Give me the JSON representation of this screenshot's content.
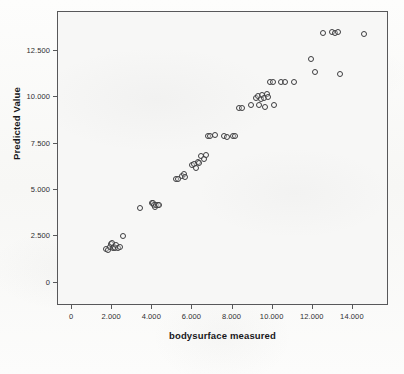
{
  "chart_data": {
    "type": "scatter",
    "title": "",
    "xlabel": "bodysurface measured",
    "ylabel": "Predicted Value",
    "xlim": [
      -700,
      15800
    ],
    "ylim": [
      -1250,
      14600
    ],
    "grid": false,
    "legend": "none",
    "marker": "open-circle",
    "xticks": [
      0,
      2000,
      4000,
      6000,
      8000,
      10000,
      12000,
      14000
    ],
    "xticklabels": [
      "0",
      "2.000",
      "4.000",
      "6.000",
      "8.000",
      "10.000",
      "12.000",
      "14.000"
    ],
    "yticks": [
      0,
      2500,
      5000,
      7500,
      10000,
      12500
    ],
    "yticklabels": [
      "0",
      "2.500",
      "5.000",
      "7.500",
      "10.000",
      "12.500"
    ],
    "points": [
      {
        "x": 1680,
        "y": 1800
      },
      {
        "x": 1800,
        "y": 1780
      },
      {
        "x": 1880,
        "y": 1950
      },
      {
        "x": 1950,
        "y": 2080
      },
      {
        "x": 2000,
        "y": 2150
      },
      {
        "x": 2030,
        "y": 1900
      },
      {
        "x": 2090,
        "y": 1950
      },
      {
        "x": 2130,
        "y": 1850
      },
      {
        "x": 2200,
        "y": 2050
      },
      {
        "x": 2280,
        "y": 1900
      },
      {
        "x": 2400,
        "y": 1950
      },
      {
        "x": 2550,
        "y": 2520
      },
      {
        "x": 3400,
        "y": 4050
      },
      {
        "x": 3980,
        "y": 4280
      },
      {
        "x": 4040,
        "y": 4300
      },
      {
        "x": 4080,
        "y": 4180
      },
      {
        "x": 4130,
        "y": 4100
      },
      {
        "x": 4200,
        "y": 4180
      },
      {
        "x": 4260,
        "y": 4220
      },
      {
        "x": 4320,
        "y": 4200
      },
      {
        "x": 5160,
        "y": 5620
      },
      {
        "x": 5300,
        "y": 5620
      },
      {
        "x": 5480,
        "y": 5780
      },
      {
        "x": 5560,
        "y": 5880
      },
      {
        "x": 5620,
        "y": 5700
      },
      {
        "x": 5980,
        "y": 6350
      },
      {
        "x": 6060,
        "y": 6400
      },
      {
        "x": 6200,
        "y": 6180
      },
      {
        "x": 6280,
        "y": 6500
      },
      {
        "x": 6340,
        "y": 6450
      },
      {
        "x": 6420,
        "y": 6820
      },
      {
        "x": 6560,
        "y": 6700
      },
      {
        "x": 6700,
        "y": 6900
      },
      {
        "x": 6780,
        "y": 7900
      },
      {
        "x": 6900,
        "y": 7900
      },
      {
        "x": 7150,
        "y": 7950
      },
      {
        "x": 7560,
        "y": 7900
      },
      {
        "x": 7700,
        "y": 7880
      },
      {
        "x": 8020,
        "y": 7920
      },
      {
        "x": 8120,
        "y": 7900
      },
      {
        "x": 8320,
        "y": 9450
      },
      {
        "x": 8480,
        "y": 9450
      },
      {
        "x": 8900,
        "y": 9600
      },
      {
        "x": 9180,
        "y": 9950
      },
      {
        "x": 9280,
        "y": 10050
      },
      {
        "x": 9340,
        "y": 9600
      },
      {
        "x": 9420,
        "y": 9900
      },
      {
        "x": 9480,
        "y": 10150
      },
      {
        "x": 9560,
        "y": 9980
      },
      {
        "x": 9600,
        "y": 9500
      },
      {
        "x": 9700,
        "y": 10200
      },
      {
        "x": 9760,
        "y": 10000
      },
      {
        "x": 10060,
        "y": 9580
      },
      {
        "x": 9880,
        "y": 10800
      },
      {
        "x": 10040,
        "y": 10800
      },
      {
        "x": 10420,
        "y": 10800
      },
      {
        "x": 10620,
        "y": 10800
      },
      {
        "x": 11040,
        "y": 10800
      },
      {
        "x": 11900,
        "y": 12050
      },
      {
        "x": 12100,
        "y": 11350
      },
      {
        "x": 12500,
        "y": 13450
      },
      {
        "x": 12950,
        "y": 13500
      },
      {
        "x": 13100,
        "y": 13480
      },
      {
        "x": 13250,
        "y": 13500
      },
      {
        "x": 13380,
        "y": 11250
      },
      {
        "x": 14550,
        "y": 13400
      }
    ]
  }
}
